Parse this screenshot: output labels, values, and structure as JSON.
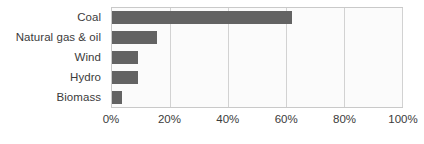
{
  "chart_data": {
    "type": "bar",
    "orientation": "horizontal",
    "title": "",
    "subtitle": "",
    "xlabel": "",
    "ylabel": "",
    "categories": [
      "Coal",
      "Natural gas & oil",
      "Wind",
      "Hydro",
      "Biomass"
    ],
    "values": [
      62,
      15.5,
      9,
      9,
      3.5
    ],
    "series": [
      {
        "name": "Share of generation",
        "values": [
          62,
          15.5,
          9,
          9,
          3.5
        ]
      }
    ],
    "value_unit": "%",
    "xlim": [
      0,
      100
    ],
    "x_tick_values": [
      0,
      20,
      40,
      60,
      80,
      100
    ],
    "x_tick_labels": [
      "0%",
      "20%",
      "40%",
      "60%",
      "80%",
      "100%"
    ],
    "grid": {
      "vertical": true,
      "horizontal": false
    },
    "legend": {
      "visible": false,
      "position": "none",
      "entries": []
    },
    "annotations": [],
    "colors": {
      "bar": "#636363",
      "gridline": "#d2d2d2",
      "plot_border": "#c9c9c9",
      "plot_background": "#fbfbfb",
      "text": "#3b3b3b",
      "page_background": "#ffffff"
    }
  }
}
